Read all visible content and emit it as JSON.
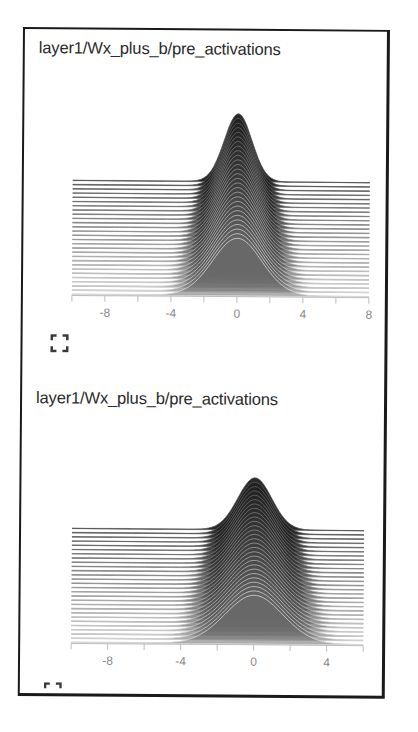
{
  "colors": {
    "frame_border": "#1a1a1a",
    "title_text": "#2a2a2a",
    "axis": "#bdbdbd",
    "tick_label": "#8a8a8a",
    "ridge_front": "#6e6e6e",
    "ridge_back": "#1e1e1e",
    "ridge_outline": "#d8d8d8",
    "icon": "#3a3a3a"
  },
  "cards": [
    {
      "title": "layer1/Wx_plus_b/pre_activations",
      "fullscreen_icon": "fullscreen-icon",
      "fullscreen_label": "Toggle fullscreen"
    },
    {
      "title": "layer1/Wx_plus_b/pre_activations",
      "fullscreen_icon": "fullscreen-icon",
      "fullscreen_label": "Toggle fullscreen"
    }
  ],
  "chart_data": [
    {
      "type": "area",
      "subtype": "ridgeline-histogram (offset mode)",
      "title": "layer1/Wx_plus_b/pre_activations",
      "xlabel": "",
      "ylabel": "",
      "xlim": [
        -10,
        8
      ],
      "x_ticks": [
        -10,
        -8,
        -6,
        -4,
        -2,
        0,
        2,
        4,
        6,
        8
      ],
      "x_tick_labels": [
        "-8",
        "-4",
        "0",
        "4",
        "8"
      ],
      "x_tick_label_values": [
        -8,
        -4,
        0,
        4,
        8
      ],
      "grid": false,
      "legend": "none",
      "num_steps": 28,
      "distribution": {
        "shape": "gaussian-like, centered at 0",
        "center": 0,
        "support_approx": [
          -4,
          4
        ],
        "earliest_step_sigma": 1.6,
        "latest_step_sigma": 0.9,
        "note": "Later steps (back, darker) become narrower and taller; earliest step (front, lightest) is widest"
      }
    },
    {
      "type": "area",
      "subtype": "ridgeline-histogram (offset mode)",
      "title": "layer1/Wx_plus_b/pre_activations",
      "xlabel": "",
      "ylabel": "",
      "xlim": [
        -10,
        6
      ],
      "x_ticks": [
        -10,
        -8,
        -6,
        -4,
        -2,
        0,
        2,
        4,
        6
      ],
      "x_tick_labels": [
        "-8",
        "-4",
        "0",
        "4"
      ],
      "x_tick_label_values": [
        -8,
        -4,
        0,
        4
      ],
      "grid": false,
      "legend": "none",
      "num_steps": 28,
      "distribution": {
        "shape": "gaussian-like, centered at 0",
        "center": 0,
        "support_approx": [
          -5,
          4
        ],
        "earliest_step_sigma": 1.7,
        "latest_step_sigma": 1.0,
        "note": "Later steps (back, darker) become narrower and taller; earliest step (front, lightest) is widest"
      }
    }
  ]
}
